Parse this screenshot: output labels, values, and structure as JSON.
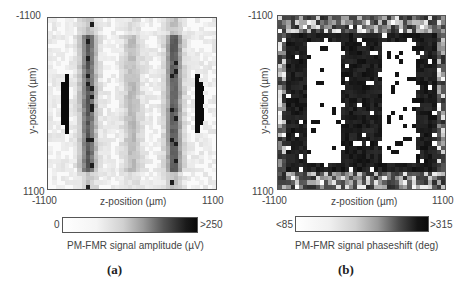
{
  "figure": {
    "panels": [
      {
        "id": "a",
        "caption": "(a)",
        "y_top_tick": "-1100",
        "y_bottom_tick": "1100",
        "x_left_tick": "-1100",
        "x_right_tick": "1100",
        "xlabel": "z-position (µm)",
        "ylabel": "y-position (µm)",
        "colorbar": {
          "min_label": "0",
          "max_label": ">250",
          "title": "PM-FMR signal amplitude (µV)"
        }
      },
      {
        "id": "b",
        "caption": "(b)",
        "y_top_tick": "-1100",
        "y_bottom_tick": "1100",
        "x_left_tick": "-1100",
        "x_right_tick": "1100",
        "xlabel": "z-position (µm)",
        "ylabel": "y-position (µm)",
        "colorbar": {
          "min_label": "<85",
          "max_label": ">315",
          "title": "PM-FMR signal phaseshift (deg)"
        }
      }
    ]
  },
  "chart_data": [
    {
      "type": "heatmap",
      "title": "(a)",
      "xlabel": "z-position (µm)",
      "ylabel": "y-position (µm)",
      "xlim": [
        -1100,
        1100
      ],
      "ylim": [
        -1100,
        1100
      ],
      "colorbar": {
        "label": "PM-FMR signal amplitude (µV)",
        "range": [
          0,
          250
        ],
        "min_label": "0",
        "max_label": ">250",
        "colormap": "white-to-black grayscale"
      },
      "description": "Circular sample region; black crescents at left and right edges (>250 µV), two grey vertical stripes near z≈-500 and z≈+500, faint central stripe near z≈0, white elsewhere."
    },
    {
      "type": "heatmap",
      "title": "(b)",
      "xlabel": "z-position (µm)",
      "ylabel": "y-position (µm)",
      "xlim": [
        -1100,
        1100
      ],
      "ylim": [
        -1100,
        1100
      ],
      "colorbar": {
        "label": "PM-FMR signal phaseshift (deg)",
        "range": [
          85,
          315
        ],
        "min_label": "<85",
        "max_label": ">315",
        "colormap": "white-to-black grayscale"
      },
      "description": "Alternating vertical bands: dark (>315 deg) at edges and centre, two white (<85 deg) bands near z≈-450 and z≈+450; noisy mixed grey pixels at top and bottom rows."
    }
  ]
}
